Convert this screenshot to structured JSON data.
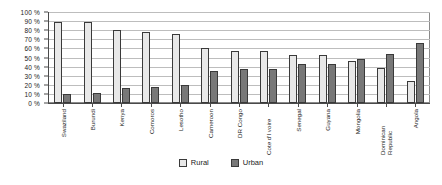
{
  "chart_data": {
    "type": "bar",
    "title": "",
    "subtitle": "",
    "xlabel": "",
    "ylabel": "",
    "ylim": [
      0,
      100
    ],
    "grid": true,
    "legend_position": "bottom-center",
    "y_ticks": [
      "0 %",
      "10 %",
      "20 %",
      "30 %",
      "40 %",
      "50 %",
      "60 %",
      "70 %",
      "80 %",
      "90 %",
      "100 %"
    ],
    "y_tick_values": [
      0,
      10,
      20,
      30,
      40,
      50,
      60,
      70,
      80,
      90,
      100
    ],
    "categories": [
      "Swaziland",
      "Burundi",
      "Kenya",
      "Comoros",
      "Lesotho",
      "Cameroon",
      "DR Congo",
      "Cote d'I voire",
      "Senegal",
      "Guyana",
      "Mongolia",
      "Dominican Republic",
      "Angola"
    ],
    "series": [
      {
        "name": "Rural",
        "color": "#e8e8e8",
        "values": [
          89,
          89,
          80,
          78,
          76,
          60,
          57,
          57,
          53,
          53,
          46,
          38,
          24
        ]
      },
      {
        "name": "Urban",
        "color": "#787878",
        "values": [
          10,
          11,
          16,
          18,
          20,
          35,
          37,
          37,
          43,
          43,
          48,
          54,
          66
        ]
      }
    ]
  },
  "legend": {
    "items": [
      {
        "label": "Rural"
      },
      {
        "label": "Urban"
      }
    ]
  }
}
